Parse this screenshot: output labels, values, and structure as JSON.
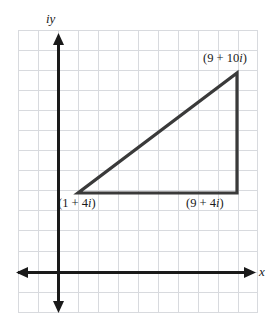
{
  "figure": {
    "type": "coordinate-plane-diagram",
    "background_color": "#ffffff",
    "grid": {
      "color": "#d6d8dc",
      "cell_size": 20,
      "left": 18,
      "top": 30,
      "right": 258,
      "bottom": 313,
      "columns": 12,
      "rows": 14
    },
    "axes": {
      "color": "#1a1a1a",
      "origin": {
        "x": 58,
        "y": 272
      },
      "x_axis": {
        "label": "x",
        "start_x": 16,
        "end_x": 256,
        "y": 272,
        "arrows": "both"
      },
      "y_axis": {
        "label": "iy",
        "x": 58,
        "start_y": 33,
        "end_y": 313,
        "arrows": "both"
      }
    },
    "triangle": {
      "color": "#333333",
      "stroke_width": 3,
      "vertices": [
        {
          "name": "bottom-left",
          "label": "(1 + 4i)",
          "real": 1,
          "imaginary": 4,
          "px": 78,
          "py": 193
        },
        {
          "name": "bottom-right",
          "label": "(9 + 4i)",
          "real": 9,
          "imaginary": 4,
          "px": 237,
          "py": 193
        },
        {
          "name": "top-right",
          "label": "(9 + 10i)",
          "real": 9,
          "imaginary": 10,
          "px": 237,
          "py": 73
        }
      ],
      "legs": [
        {
          "name": "horizontal-leg",
          "from": "bottom-left",
          "to": "bottom-right",
          "length": 8
        },
        {
          "name": "vertical-leg",
          "from": "bottom-right",
          "to": "top-right",
          "length": 6
        },
        {
          "name": "hypotenuse",
          "from": "bottom-left",
          "to": "top-right",
          "length": 10
        }
      ]
    },
    "labels": {
      "y_axis_label": "iy",
      "x_axis_label": "x",
      "top_right_prefix": "(9 + 10",
      "top_right_imaginary_unit": "i",
      "top_right_suffix": ")",
      "bottom_left_prefix": "(1 + 4",
      "bottom_left_imaginary_unit": "i",
      "bottom_left_suffix": ")",
      "bottom_right_prefix": "(9 + 4",
      "bottom_right_imaginary_unit": "i",
      "bottom_right_suffix": ")"
    }
  }
}
